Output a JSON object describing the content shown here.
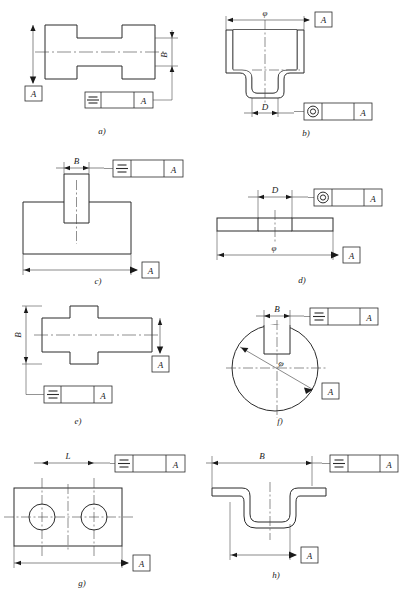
{
  "drawing": {
    "title": "Symmetry and concentricity tolerance application examples",
    "datum_letter": "A",
    "symbols": {
      "symmetry": "symmetry-symbol",
      "concentricity": "concentricity-symbol",
      "datum_triangle": "datum-triangle"
    }
  },
  "figures": [
    {
      "id": "a",
      "label": "a)",
      "dimensions": [
        {
          "name": "B",
          "text": "B"
        }
      ],
      "tolerance_symbol": "symmetry",
      "datum": "A",
      "frame_datum_letter": "A"
    },
    {
      "id": "b",
      "label": "b)",
      "dimensions": [
        {
          "name": "phi",
          "text": "φ"
        },
        {
          "name": "D",
          "text": "D"
        }
      ],
      "tolerance_symbol": "concentricity",
      "datum": "A",
      "frame_datum_letter": "A"
    },
    {
      "id": "c",
      "label": "c)",
      "dimensions": [
        {
          "name": "B",
          "text": "B"
        }
      ],
      "tolerance_symbol": "symmetry",
      "datum": "A",
      "frame_datum_letter": "A"
    },
    {
      "id": "d",
      "label": "d)",
      "dimensions": [
        {
          "name": "D",
          "text": "D"
        },
        {
          "name": "phi",
          "text": "φ"
        }
      ],
      "tolerance_symbol": "concentricity",
      "datum": "A",
      "frame_datum_letter": "A"
    },
    {
      "id": "e",
      "label": "e)",
      "dimensions": [
        {
          "name": "B",
          "text": "B"
        }
      ],
      "tolerance_symbol": "symmetry",
      "datum": "A",
      "frame_datum_letter": "A"
    },
    {
      "id": "f",
      "label": "f)",
      "dimensions": [
        {
          "name": "B",
          "text": "B"
        },
        {
          "name": "phi",
          "text": "φ"
        }
      ],
      "tolerance_symbol": "symmetry",
      "datum": "A",
      "frame_datum_letter": "A"
    },
    {
      "id": "g",
      "label": "g)",
      "dimensions": [
        {
          "name": "L",
          "text": "L"
        }
      ],
      "tolerance_symbol": "symmetry",
      "datum": "A",
      "frame_datum_letter": "A"
    },
    {
      "id": "h",
      "label": "h)",
      "dimensions": [
        {
          "name": "B",
          "text": "B"
        }
      ],
      "tolerance_symbol": "symmetry",
      "datum": "A",
      "frame_datum_letter": "A"
    }
  ],
  "colors": {
    "line": "#2b2b2b",
    "dimension_line": "#3a3a3a",
    "center_line": "#444444",
    "background": "#ffffff"
  }
}
